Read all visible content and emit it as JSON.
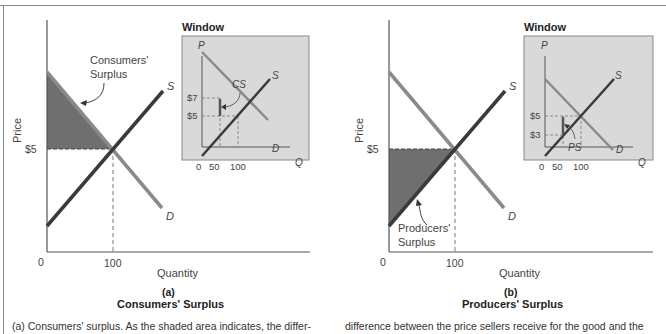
{
  "figure": {
    "panels": [
      {
        "id": "a",
        "letter_label": "(a)",
        "title": "Consumers' Surplus",
        "y_axis_label": "Price",
        "x_axis_label": "Quantity",
        "price_tick": "$5",
        "quantity_tick": "100",
        "origin_label": "0",
        "supply_label": "S",
        "demand_label": "D",
        "surplus_annotation": [
          "Consumers'",
          "Surplus"
        ],
        "shade_color": "#6f6f6f",
        "window": {
          "title": "Window",
          "p_label": "P",
          "q_label": "Q",
          "s_label": "S",
          "d_label": "D",
          "price_ticks": [
            "$7",
            "$5"
          ],
          "quantity_ticks": [
            "0",
            "50",
            "100"
          ],
          "surplus_label": "CS"
        }
      },
      {
        "id": "b",
        "letter_label": "(b)",
        "title": "Producers' Surplus",
        "y_axis_label": "Price",
        "x_axis_label": "Quantity",
        "price_tick": "$5",
        "quantity_tick": "100",
        "origin_label": "0",
        "supply_label": "S",
        "demand_label": "D",
        "surplus_annotation": [
          "Producers'",
          "Surplus"
        ],
        "shade_color": "#6f6f6f",
        "window": {
          "title": "Window",
          "p_label": "P",
          "q_label": "Q",
          "s_label": "S",
          "d_label": "D",
          "price_ticks": [
            "$5",
            "$3"
          ],
          "quantity_ticks": [
            "0",
            "50",
            "100"
          ],
          "surplus_label": "PS"
        }
      }
    ],
    "captions": {
      "left": "(a) Consumers' surplus. As the shaded area indicates, the differ-",
      "right": "difference between the price sellers receive for the good and the"
    },
    "colors": {
      "supply_line": "#3a3a3a",
      "demand_line": "#8a8a8a",
      "window_bg": "#d9d9d9",
      "axis": "#555555"
    }
  }
}
